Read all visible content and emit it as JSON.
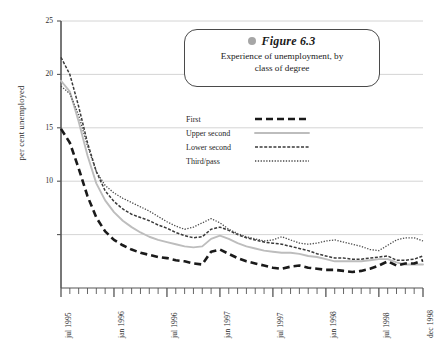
{
  "callout": {
    "dot": "bullet-dot",
    "title": "Figure 6.3",
    "subtitle_line1": "Experience of unemployment, by",
    "subtitle_line2": "class of degree"
  },
  "axes": {
    "ylabel": "per cent unemployed",
    "yticks": [
      "25",
      "20",
      "15",
      "10"
    ],
    "xticks": [
      "jul 1995",
      "jan 1996",
      "jul 1996",
      "jan 1997",
      "jul 1997",
      "jan 1998",
      "jul 1998",
      "dec 1998"
    ]
  },
  "legend": {
    "items": [
      {
        "label": "First",
        "style": "thick-dashed",
        "color": "#1a1a1a"
      },
      {
        "label": "Upper second",
        "style": "solid-light",
        "color": "#bdbdbd"
      },
      {
        "label": "Lower second",
        "style": "short-dashed",
        "color": "#3a3a3a"
      },
      {
        "label": "Third/pass",
        "style": "dotted",
        "color": "#4a4a4a"
      }
    ]
  },
  "chart_data": {
    "type": "line",
    "xlabel": "",
    "ylabel": "per cent unemployed",
    "ylim": [
      0,
      25
    ],
    "yticks": [
      0,
      5,
      10,
      15,
      20,
      25
    ],
    "ytick_labels": [
      "",
      "",
      "10",
      "15",
      "20",
      "25"
    ],
    "grid": true,
    "legend_position": "inside-upper-right",
    "x": [
      "jul 1995",
      "aug 1995",
      "sep 1995",
      "oct 1995",
      "nov 1995",
      "dec 1995",
      "jan 1996",
      "feb 1996",
      "mar 1996",
      "apr 1996",
      "may 1996",
      "jun 1996",
      "jul 1996",
      "aug 1996",
      "sep 1996",
      "oct 1996",
      "nov 1996",
      "dec 1996",
      "jan 1997",
      "feb 1997",
      "mar 1997",
      "apr 1997",
      "may 1997",
      "jun 1997",
      "jul 1997",
      "aug 1997",
      "sep 1997",
      "oct 1997",
      "nov 1997",
      "dec 1997",
      "jan 1998",
      "feb 1998",
      "mar 1998",
      "apr 1998",
      "may 1998",
      "jun 1998",
      "jul 1998",
      "aug 1998",
      "sep 1998",
      "oct 1998",
      "nov 1998",
      "dec 1998"
    ],
    "xtick_labels": [
      "jul 1995",
      "jan 1996",
      "jul 1996",
      "jan 1997",
      "jul 1997",
      "jan 1998",
      "jul 1998",
      "dec 1998"
    ],
    "series": [
      {
        "name": "First",
        "style": "thick-dashed",
        "color": "#1a1a1a",
        "values": [
          14.9,
          13.6,
          11.2,
          8.6,
          6.6,
          5.3,
          4.5,
          4.0,
          3.6,
          3.3,
          3.1,
          2.9,
          2.8,
          2.6,
          2.5,
          2.3,
          2.2,
          3.4,
          3.6,
          3.2,
          2.8,
          2.5,
          2.3,
          2.1,
          1.9,
          1.8,
          2.0,
          2.1,
          1.9,
          1.8,
          1.7,
          1.7,
          1.6,
          1.5,
          1.6,
          1.8,
          2.1,
          2.5,
          2.1,
          2.3,
          2.3,
          2.6
        ]
      },
      {
        "name": "Upper second",
        "style": "solid-light",
        "color": "#bdbdbd",
        "values": [
          19.4,
          18.4,
          15.6,
          12.4,
          9.8,
          8.2,
          7.1,
          6.3,
          5.7,
          5.2,
          4.8,
          4.5,
          4.3,
          4.1,
          3.9,
          3.8,
          3.9,
          4.6,
          4.9,
          4.6,
          4.2,
          3.9,
          3.7,
          3.5,
          3.4,
          3.3,
          3.3,
          3.2,
          3.0,
          2.9,
          2.7,
          2.5,
          2.5,
          2.5,
          2.5,
          2.6,
          2.7,
          2.7,
          2.4,
          2.2,
          2.2,
          2.2
        ]
      },
      {
        "name": "Lower second",
        "style": "short-dashed",
        "color": "#3a3a3a",
        "values": [
          21.6,
          20.0,
          17.0,
          13.6,
          10.9,
          9.1,
          8.1,
          7.4,
          6.9,
          6.6,
          6.3,
          5.9,
          5.6,
          5.2,
          4.9,
          4.7,
          4.8,
          5.5,
          5.7,
          5.4,
          5.0,
          4.7,
          4.5,
          4.3,
          4.2,
          4.1,
          3.9,
          3.7,
          3.5,
          3.2,
          3.0,
          2.8,
          2.8,
          2.7,
          2.7,
          2.8,
          2.9,
          3.0,
          2.6,
          2.6,
          2.7,
          3.0
        ]
      },
      {
        "name": "Third/pass",
        "style": "dotted",
        "color": "#4a4a4a",
        "values": [
          18.9,
          18.2,
          16.2,
          13.3,
          10.9,
          9.6,
          8.9,
          8.4,
          8.0,
          7.6,
          7.2,
          6.7,
          6.2,
          5.8,
          5.5,
          5.7,
          6.1,
          6.5,
          6.1,
          5.5,
          5.1,
          4.8,
          4.6,
          4.4,
          4.5,
          4.8,
          4.5,
          4.2,
          4.1,
          4.2,
          4.4,
          4.5,
          4.3,
          4.1,
          3.9,
          3.6,
          3.5,
          4.0,
          4.5,
          4.7,
          4.7,
          4.4
        ]
      }
    ]
  },
  "plot_geometry": {
    "left": 61,
    "right": 423,
    "top": 21,
    "bottom": 288,
    "y_max": 25,
    "minor_tick_count": 42
  }
}
